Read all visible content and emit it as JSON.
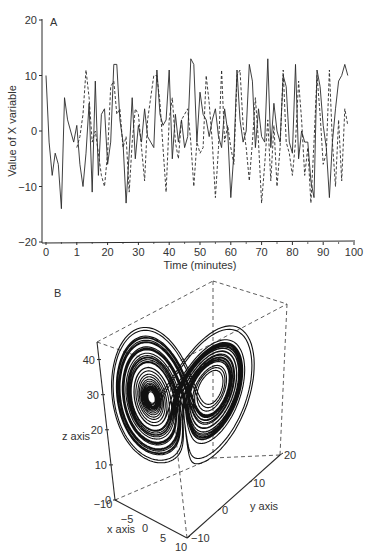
{
  "chart_data": [
    {
      "panel": "A",
      "type": "line",
      "title": "",
      "xlabel": "Time (minutes)",
      "ylabel": "Value of X variable",
      "xlim": [
        0,
        100
      ],
      "ylim": [
        -20,
        20
      ],
      "x_ticks": [
        "0",
        "1",
        "20",
        "30",
        "40",
        "50",
        "60",
        "70",
        "80",
        "90",
        "100"
      ],
      "y_ticks": [
        "20",
        "10",
        "0",
        "-10",
        "-20"
      ],
      "grid": false,
      "legend": "none",
      "series": [
        {
          "name": "solid",
          "style": "solid",
          "x": [
            0,
            1,
            2,
            3,
            4,
            5,
            6,
            7,
            8,
            9,
            10,
            11,
            12,
            13,
            14,
            15,
            16,
            17,
            18,
            19,
            20,
            21,
            22,
            23,
            24,
            25,
            26,
            27,
            28,
            29,
            30,
            31,
            32,
            33,
            34,
            35,
            36,
            37,
            38,
            39,
            40,
            41,
            42,
            43,
            44,
            45,
            46,
            47,
            48,
            49,
            50,
            51,
            52,
            53,
            54,
            55,
            56,
            57,
            58,
            59,
            60,
            61,
            62,
            63,
            64,
            65,
            66,
            67,
            68,
            69,
            70,
            71,
            72,
            73,
            74,
            75,
            76,
            77,
            78,
            79,
            80,
            81,
            82,
            83,
            84,
            85,
            86,
            87,
            88,
            89,
            90,
            91,
            92,
            93,
            94,
            95,
            96,
            97,
            98
          ],
          "values": [
            10,
            -2,
            -8,
            -4,
            -6,
            -14,
            6,
            2,
            0,
            -2,
            1,
            -6,
            -10,
            -4,
            5,
            -11,
            9,
            -8,
            3,
            4,
            -6,
            -2,
            12,
            12,
            2,
            -2,
            -13,
            -4,
            6,
            -5,
            1,
            -2,
            4,
            -1,
            -2,
            -3,
            11,
            3,
            1,
            2,
            11,
            -5,
            3,
            -2,
            2,
            -3,
            -1,
            13,
            12,
            -2,
            7,
            3,
            2,
            -1,
            2,
            4,
            -1,
            -3,
            4,
            0,
            -12,
            -4,
            11,
            2,
            -2,
            0,
            12,
            9,
            -3,
            4,
            -1,
            -2,
            13,
            -3,
            5,
            0,
            -2,
            10,
            8,
            -2,
            -4,
            12,
            -5,
            0,
            -2,
            -2,
            -9,
            -12,
            11,
            8,
            1,
            -3,
            -12,
            -2,
            4,
            9,
            10,
            12,
            10
          ]
        },
        {
          "name": "dashed",
          "style": "dashed",
          "x": [
            10,
            11,
            12,
            13,
            14,
            15,
            16,
            17,
            18,
            19,
            20,
            21,
            22,
            23,
            24,
            25,
            26,
            27,
            28,
            29,
            30,
            31,
            32,
            33,
            34,
            35,
            36,
            37,
            38,
            39,
            40,
            41,
            42,
            43,
            44,
            45,
            46,
            47,
            48,
            49,
            50,
            51,
            52,
            53,
            54,
            55,
            56,
            57,
            58,
            59,
            60,
            61,
            62,
            63,
            64,
            65,
            66,
            67,
            68,
            69,
            70,
            71,
            72,
            73,
            74,
            75,
            76,
            77,
            78,
            79,
            80,
            81,
            82,
            83,
            84,
            85,
            86,
            87,
            88,
            89,
            90,
            91,
            92,
            93,
            94,
            95,
            96,
            97,
            98
          ],
          "values": [
            -3,
            -1,
            3,
            11,
            6,
            -2,
            0,
            -4,
            -8,
            -10,
            -4,
            8,
            9,
            3,
            4,
            -3,
            -1,
            -11,
            -2,
            4,
            3,
            -3,
            -9,
            2,
            6,
            10,
            10,
            5,
            -3,
            -11,
            2,
            6,
            -2,
            -5,
            2,
            3,
            4,
            -2,
            -10,
            -2,
            -4,
            -3,
            10,
            5,
            -2,
            -12,
            -3,
            11,
            -2,
            1,
            -3,
            -6,
            10,
            11,
            1,
            -3,
            -9,
            -2,
            6,
            -2,
            -13,
            -6,
            2,
            -9,
            1,
            -10,
            -3,
            11,
            -2,
            -4,
            -8,
            -2,
            9,
            2,
            -8,
            -3,
            -13,
            -2,
            10,
            3,
            -6,
            -4,
            11,
            -2,
            -10,
            2,
            -9,
            4,
            1
          ]
        }
      ],
      "annotation": "A"
    },
    {
      "panel": "B",
      "type": "line",
      "subtype": "3d-trajectory",
      "title": "",
      "xlabel": "x axis",
      "ylabel": "y axis",
      "zlabel": "z axis",
      "xlim": [
        -10,
        10
      ],
      "ylim": [
        -10,
        20
      ],
      "zlim": [
        0,
        45
      ],
      "x_ticks": [
        "-10",
        "-5",
        "0",
        "5",
        "10"
      ],
      "y_ticks": [
        "-10",
        "0",
        "10",
        "20"
      ],
      "z_ticks": [
        "0",
        "10",
        "20",
        "30",
        "40"
      ],
      "grid": false,
      "box": "dashed bounding box",
      "description": "Lorenz attractor butterfly trajectory with two lobes",
      "annotation": "B"
    }
  ],
  "panel_a": {
    "label": "A",
    "xlabel": "Time (minutes)",
    "ylabel": "Value of X variable",
    "x_ticks": [
      "0",
      "1",
      "20",
      "30",
      "40",
      "50",
      "60",
      "70",
      "80",
      "90",
      "100"
    ],
    "y_ticks": [
      "20",
      "10",
      "0",
      "−10",
      "−20"
    ]
  },
  "panel_b": {
    "label": "B",
    "xlabel": "x axis",
    "ylabel": "y axis",
    "zlabel": "z axis",
    "x_ticks": [
      "−10",
      "−5",
      "0",
      "5",
      "10"
    ],
    "y_ticks": [
      "−10",
      "0",
      "10",
      "20"
    ],
    "z_ticks": [
      "0",
      "10",
      "20",
      "30",
      "40"
    ]
  },
  "colors": {
    "ink": "#2a2a2a",
    "text": "#333333",
    "background": "#ffffff"
  }
}
